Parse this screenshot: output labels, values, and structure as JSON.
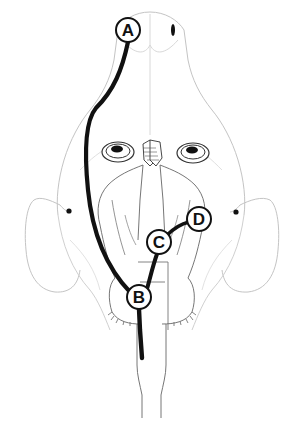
{
  "figure": {
    "colors": {
      "outline": "#bdbdbd",
      "brain_outline": "#555555",
      "track": "#111111",
      "label_border": "#111111",
      "label_fill": "#ffffff",
      "background": "#ffffff"
    },
    "labels": [
      {
        "id": "A",
        "text": "A",
        "x": 128,
        "y": 30
      },
      {
        "id": "B",
        "text": "B",
        "x": 139,
        "y": 297
      },
      {
        "id": "C",
        "text": "C",
        "x": 159,
        "y": 242
      },
      {
        "id": "D",
        "text": "D",
        "x": 199,
        "y": 219
      }
    ],
    "tracks": [
      {
        "from": "A",
        "to": "B",
        "name": "track-a-b"
      },
      {
        "from": "C",
        "to": "B",
        "name": "track-c-b"
      },
      {
        "from": "D",
        "to": "C",
        "name": "track-d-c"
      },
      {
        "from": "B",
        "to": "spinal",
        "name": "track-b-down"
      }
    ]
  }
}
